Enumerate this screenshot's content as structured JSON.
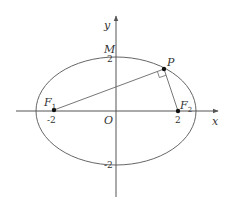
{
  "diagram": {
    "type": "ellipse-foci",
    "axes": {
      "x_label": "x",
      "y_label": "y",
      "origin_label": "O"
    },
    "ticks": {
      "x_neg": "-2",
      "x_pos": "2",
      "y_pos": "2",
      "y_neg": "-2"
    },
    "points": {
      "F1": {
        "label": "F",
        "sub": "1"
      },
      "F2": {
        "label": "F",
        "sub": "2"
      },
      "P": {
        "label": "P"
      },
      "M": {
        "label": "M"
      }
    },
    "annotations": {
      "right_angle_at": "P"
    },
    "colors": {
      "stroke": "#555555",
      "point": "#111111"
    }
  }
}
